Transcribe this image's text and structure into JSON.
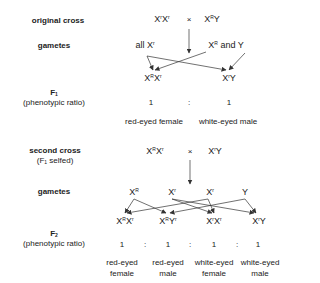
{
  "original_cross": {
    "label": "original cross",
    "female": {
      "base": "X",
      "sup1": "r",
      "base2": "X",
      "sup2": "r"
    },
    "times": "×",
    "male": {
      "base": "X",
      "sup1": "R",
      "base2": "Y",
      "sup2": ""
    }
  },
  "gametes1": {
    "label": "gametes",
    "female": {
      "prefix": "all ",
      "base": "X",
      "sup": "r"
    },
    "male": {
      "base": "X",
      "sup": "R",
      "suffix": " and  Y"
    }
  },
  "f1": {
    "label": "F",
    "label_sub": "1",
    "sublabel": "(phenotypic ratio)",
    "genotypes": [
      {
        "b1": "X",
        "s1": "R",
        "b2": "X",
        "s2": "r"
      },
      {
        "b1": "X",
        "s1": "r",
        "b2": "Y",
        "s2": ""
      }
    ],
    "ratio": [
      "1",
      ":",
      "1"
    ],
    "phenotypes": [
      "red-eyed female",
      "white-eyed male"
    ]
  },
  "second_cross": {
    "label": "second cross",
    "sublabel_prefix": "(F",
    "sublabel_sub": "1",
    "sublabel_suffix": "  selfed)",
    "female": {
      "b1": "X",
      "s1": "R",
      "b2": "X",
      "s2": "r"
    },
    "times": "×",
    "male": {
      "b1": "X",
      "s1": "r",
      "b2": "Y",
      "s2": ""
    }
  },
  "gametes2": {
    "label": "gametes",
    "items": [
      {
        "b": "X",
        "s": "R"
      },
      {
        "b": "X",
        "s": "r"
      },
      {
        "b": "X",
        "s": "r"
      },
      {
        "b": "Y",
        "s": ""
      }
    ]
  },
  "f2": {
    "label": "F",
    "label_sub": "2",
    "sublabel": "(phenotypic ratio)",
    "genotypes": [
      {
        "b1": "X",
        "s1": "R",
        "b2": "X",
        "s2": "r"
      },
      {
        "b1": "X",
        "s1": "R",
        "b2": "Y",
        "s2": "r"
      },
      {
        "b1": "X",
        "s1": "r",
        "b2": "X",
        "s2": "r"
      },
      {
        "b1": "X",
        "s1": "r",
        "b2": "Y",
        "s2": ""
      }
    ],
    "ratio": [
      "1",
      ":",
      "1",
      ":",
      "1",
      ":",
      "1"
    ],
    "phenotypes": [
      {
        "line1": "red-eyed",
        "line2": "female"
      },
      {
        "line1": "red-eyed",
        "line2": "male"
      },
      {
        "line1": "white-eyed",
        "line2": "female"
      },
      {
        "line1": "white-eyed",
        "line2": "male"
      }
    ]
  }
}
